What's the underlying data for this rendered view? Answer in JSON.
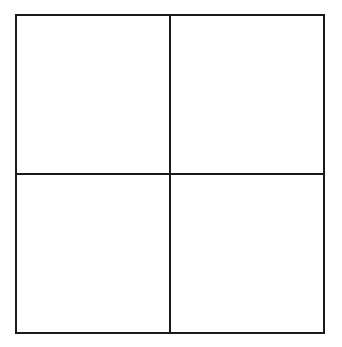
{
  "diagram": {
    "type": "grid",
    "rows": 2,
    "columns": 2,
    "line_color": "#1a1a1a",
    "background_color": "#ffffff",
    "cells": [
      {
        "row": 1,
        "col": 1,
        "label": ""
      },
      {
        "row": 1,
        "col": 2,
        "label": ""
      },
      {
        "row": 2,
        "col": 1,
        "label": ""
      },
      {
        "row": 2,
        "col": 2,
        "label": ""
      }
    ]
  }
}
